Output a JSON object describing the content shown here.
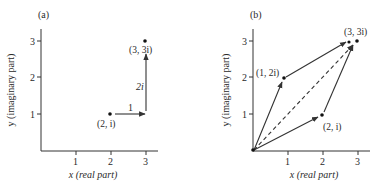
{
  "panels": [
    {
      "label": "(a)",
      "xlabel": "x (real part)",
      "ylabel": "y (imaginary part)",
      "x_ticks": [
        "1",
        "2",
        "3"
      ],
      "y_ticks": [
        "1",
        "2",
        "3"
      ],
      "points": [
        {
          "label": "(2, i)",
          "x": 2,
          "y": 1
        },
        {
          "label": "(3, 3i)",
          "x": 3,
          "y": 3
        }
      ],
      "vectors": [
        {
          "from": [
            2,
            1
          ],
          "to": [
            3,
            1
          ],
          "label": "1"
        },
        {
          "from": [
            3,
            1
          ],
          "to": [
            3,
            3
          ],
          "label": "2i"
        }
      ]
    },
    {
      "label": "(b)",
      "xlabel": "x (real part)",
      "ylabel": "y (imaginary part)",
      "x_ticks": [
        "1",
        "2",
        "3"
      ],
      "y_ticks": [
        "1",
        "2",
        "3"
      ],
      "points": [
        {
          "label": "(1, 2i)",
          "x": 1,
          "y": 2
        },
        {
          "label": "(2, i)",
          "x": 2,
          "y": 1
        },
        {
          "label": "(3, 3i)",
          "x": 3,
          "y": 3
        }
      ],
      "vectors": [
        {
          "from": [
            0,
            0
          ],
          "to": [
            1,
            2
          ],
          "style": "solid"
        },
        {
          "from": [
            0,
            0
          ],
          "to": [
            2,
            1
          ],
          "style": "solid"
        },
        {
          "from": [
            1,
            2
          ],
          "to": [
            3,
            3
          ],
          "style": "solid"
        },
        {
          "from": [
            2,
            1
          ],
          "to": [
            3,
            3
          ],
          "style": "solid"
        },
        {
          "from": [
            0,
            0
          ],
          "to": [
            3,
            3
          ],
          "style": "dashed"
        }
      ]
    }
  ]
}
